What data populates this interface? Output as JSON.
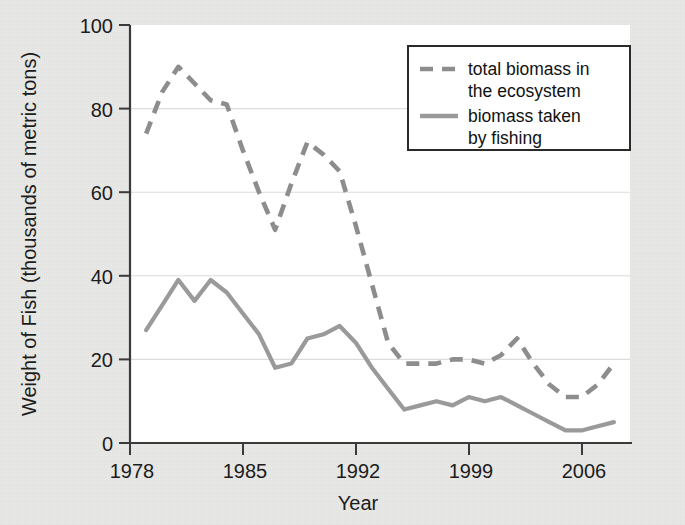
{
  "chart_data": {
    "type": "line",
    "title": "",
    "xlabel": "Year",
    "ylabel": "Weight of Fish (thousands of metric tons)",
    "xlim": [
      1977,
      2008
    ],
    "ylim": [
      0,
      100
    ],
    "xticks": [
      "1978",
      "1985",
      "1992",
      "1999",
      "2006"
    ],
    "xtick_values": [
      1978,
      1985,
      1992,
      1999,
      2006
    ],
    "yticks": [
      "0",
      "20",
      "40",
      "60",
      "80",
      "100"
    ],
    "ytick_values": [
      0,
      20,
      40,
      60,
      80,
      100
    ],
    "grid": "horizontal",
    "legend_position": "top-right",
    "x": [
      1978,
      1979,
      1980,
      1981,
      1982,
      1983,
      1984,
      1985,
      1986,
      1987,
      1988,
      1989,
      1990,
      1991,
      1992,
      1993,
      1994,
      1995,
      1996,
      1997,
      1998,
      1999,
      2000,
      2001,
      2002,
      2003,
      2004,
      2005,
      2006,
      2007
    ],
    "series": [
      {
        "name": "total biomass in the ecosystem",
        "style": "dashed",
        "color": "#8d8d8d",
        "values": [
          74,
          84,
          90,
          86,
          82,
          81,
          70,
          60,
          51,
          62,
          72,
          69,
          65,
          52,
          38,
          24,
          19,
          19,
          19,
          20,
          20,
          19,
          21,
          25,
          19,
          14,
          11,
          11,
          14,
          19
        ]
      },
      {
        "name": "biomass taken by fishing",
        "style": "solid",
        "color": "#9a9a9a",
        "values": [
          27,
          33,
          39,
          34,
          39,
          36,
          31,
          26,
          18,
          19,
          25,
          26,
          28,
          24,
          18,
          13,
          8,
          9,
          10,
          9,
          11,
          10,
          11,
          9,
          7,
          5,
          3,
          3,
          4,
          5
        ]
      }
    ]
  },
  "axes": {
    "y_title": "Weight of Fish (thousands of metric tons)",
    "x_title": "Year",
    "y_tick_labels": [
      "100",
      "80",
      "60",
      "40",
      "20",
      "0"
    ],
    "x_tick_labels": [
      "1978",
      "1985",
      "1992",
      "1999",
      "2006"
    ]
  },
  "legend": {
    "entries": [
      {
        "line1": "total biomass in",
        "line2": "the ecosystem"
      },
      {
        "line1": "biomass taken",
        "line2": "by fishing"
      }
    ]
  },
  "colors": {
    "total_biomass": "#8d8d8d",
    "biomass_fishing": "#9a9a9a",
    "axis": "#3a3a3a",
    "grid": "#dcdcdc",
    "plot_background": "#ffffff",
    "page_background": "#e9e9e7"
  }
}
